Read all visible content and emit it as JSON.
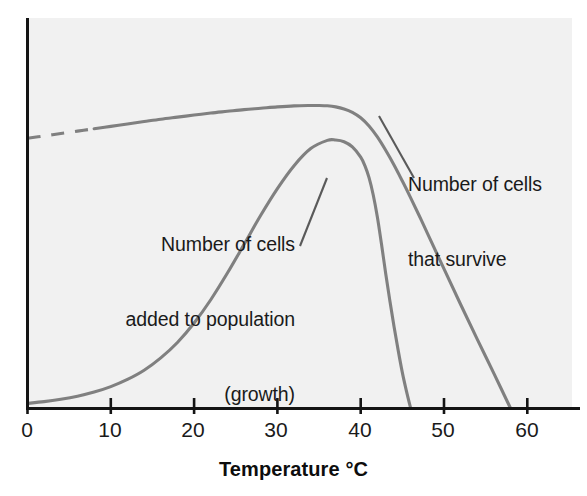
{
  "chart_data": {
    "type": "line",
    "title": "",
    "subtitle": "",
    "xlabel": "Temperature °C",
    "ylabel": "",
    "xlim": [
      0,
      63
    ],
    "ylim": [
      0,
      100
    ],
    "xticks": [
      0,
      10,
      20,
      30,
      40,
      50,
      60
    ],
    "xtick_labels": [
      "0",
      "10",
      "20",
      "30",
      "40",
      "50",
      "60"
    ],
    "yticks": [],
    "ytick_labels": [],
    "grid": false,
    "legend": "none",
    "axes_shown": [
      "left",
      "bottom"
    ],
    "background_color": "#f2f2f2",
    "axis_color": "#1a1a1a",
    "curve_color": "#808080",
    "series": [
      {
        "name": "Number of cells that survive",
        "style": "solid-with-dashed-start",
        "dashed_segment_x": [
          0,
          8
        ],
        "color": "#808080",
        "x": [
          0,
          2,
          4,
          6,
          8,
          10,
          12,
          14,
          16,
          18,
          20,
          22,
          24,
          26,
          28,
          30,
          32,
          34,
          35,
          36,
          37,
          38,
          39,
          40,
          41,
          42,
          43,
          44,
          45,
          46,
          47,
          48,
          50,
          52,
          54,
          56,
          58
        ],
        "y": [
          79,
          79.7,
          80.4,
          81.1,
          81.8,
          82.5,
          83.2,
          83.9,
          84.6,
          85.2,
          85.8,
          86.4,
          86.9,
          87.4,
          87.8,
          88.2,
          88.5,
          88.6,
          88.6,
          88.5,
          88.2,
          87.6,
          86.6,
          85.0,
          82.6,
          79.4,
          75.5,
          71.2,
          66.5,
          61.6,
          56.5,
          51.3,
          40.8,
          30.4,
          20.2,
          10.2,
          0
        ]
      },
      {
        "name": "Number of cells added to population (growth)",
        "style": "solid",
        "color": "#808080",
        "x": [
          0,
          2,
          4,
          6,
          8,
          10,
          12,
          14,
          16,
          18,
          20,
          22,
          24,
          26,
          28,
          30,
          32,
          34,
          36,
          37,
          38,
          39,
          40,
          40.5,
          41,
          41.5,
          42,
          42.5,
          43,
          43.5,
          44,
          44.5,
          45,
          45.5,
          46
        ],
        "y": [
          1.5,
          2.0,
          2.7,
          3.6,
          4.8,
          6.4,
          8.5,
          11.2,
          14.8,
          19.3,
          25.0,
          31.8,
          39.6,
          48.0,
          56.5,
          64.3,
          71.0,
          76.0,
          78.4,
          78.5,
          78.0,
          76.5,
          73.5,
          71.0,
          67.5,
          62.5,
          56.0,
          48.0,
          39.5,
          31.5,
          24.0,
          17.0,
          10.5,
          5.0,
          0
        ]
      }
    ],
    "annotations": [
      {
        "id": "survive",
        "lines": [
          "Number of cells",
          "that survive"
        ],
        "text": "Number of cells\nthat survive",
        "align": "left",
        "leader_line": {
          "from": [
            414,
            178
          ],
          "to": [
            379,
            116
          ]
        }
      },
      {
        "id": "growth",
        "lines": [
          "Number of cells",
          "added to population",
          "(growth)"
        ],
        "text": "Number of cells\nadded to population\n(growth)",
        "align": "right",
        "leader_line": {
          "from": [
            300,
            246
          ],
          "to": [
            327,
            178
          ]
        }
      }
    ]
  },
  "axis": {
    "title": "Temperature °C",
    "tick_labels": [
      "0",
      "10",
      "20",
      "30",
      "40",
      "50",
      "60"
    ]
  },
  "annotations": {
    "survive": {
      "line1": "Number of cells",
      "line2": "that survive"
    },
    "growth": {
      "line1": "Number of cells",
      "line2": "added to population",
      "line3": "(growth)"
    }
  }
}
